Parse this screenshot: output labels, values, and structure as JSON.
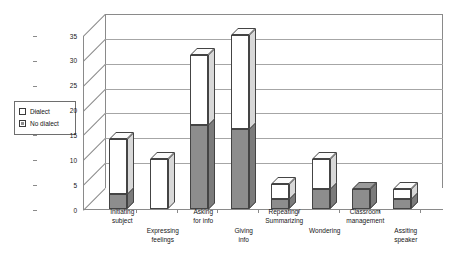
{
  "legend": {
    "items": [
      {
        "label": "Dialect",
        "swatch": "white-square-icon",
        "color": "#ffffff"
      },
      {
        "label": "No dialect",
        "swatch": "gray-square-icon",
        "color": "#8d8d8d"
      }
    ]
  },
  "axis": {
    "y_ticks": [
      "35",
      "30",
      "25",
      "20",
      "15",
      "10",
      "5",
      "0"
    ],
    "y_min": 0,
    "y_max": 35,
    "y_step": 5
  },
  "chart_data": {
    "type": "bar",
    "title": "",
    "subtitle": "",
    "xlabel": "",
    "ylabel": "",
    "ylim": [
      0,
      35
    ],
    "ytick_step": 5,
    "grid": true,
    "stacked": true,
    "three_d": true,
    "legend_position": "left",
    "categories": [
      "Initiating subject",
      "Expressing feelings",
      "Asking for info",
      "Giving info",
      "Repeating/ Summarizing",
      "Wondering",
      "Classroom management",
      "Assiting speaker"
    ],
    "category_lines": [
      [
        "Initiating",
        "subject"
      ],
      [
        "Expressing",
        "feelings"
      ],
      [
        "Asking",
        "for info"
      ],
      [
        "Giving",
        "info"
      ],
      [
        "Repeating/",
        "Summarizing"
      ],
      [
        "Wondering"
      ],
      [
        "Classroom",
        "management"
      ],
      [
        "Assiting",
        "speaker"
      ]
    ],
    "series": [
      {
        "name": "No dialect",
        "color": "#8d8d8d",
        "values": [
          3,
          0,
          17,
          16,
          2,
          4,
          4,
          2
        ]
      },
      {
        "name": "Dialect",
        "color": "#ffffff",
        "values": [
          11,
          10,
          14,
          19,
          3,
          6,
          0,
          2
        ]
      }
    ],
    "totals": [
      14,
      10,
      31,
      35,
      5,
      10,
      4,
      4
    ]
  }
}
